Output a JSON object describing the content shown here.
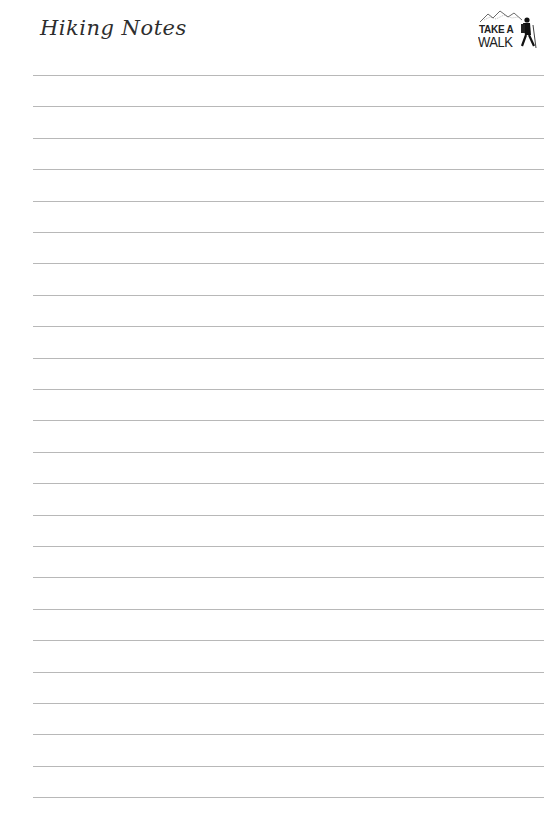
{
  "page": {
    "title": "Hiking Notes",
    "logo": {
      "line1": "TAKE A",
      "line2": "WALK",
      "icon": "hiker-mountain-icon"
    }
  },
  "ruled_lines": {
    "count": 24,
    "first_y": 75,
    "spacing": 31.4,
    "color": "#b8b8b8"
  }
}
